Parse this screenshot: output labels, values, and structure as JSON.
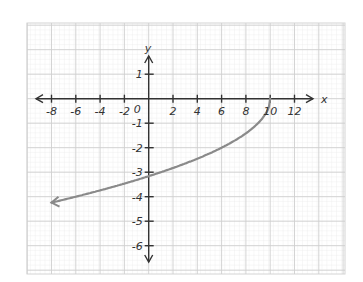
{
  "chart_data": {
    "type": "line",
    "title": "",
    "xlabel": "x",
    "ylabel": "y",
    "origin_label": "0",
    "xlim": [
      -9,
      13
    ],
    "ylim": [
      -7,
      2
    ],
    "x_ticks": [
      -8,
      -6,
      -4,
      -2,
      2,
      4,
      6,
      8,
      10,
      12
    ],
    "x_tick_labels": [
      "-8",
      "-6",
      "-4",
      "-2",
      "2",
      "4",
      "6",
      "8",
      "10",
      "12"
    ],
    "y_ticks": [
      1,
      -1,
      -2,
      -3,
      -4,
      -5,
      -6
    ],
    "y_tick_labels": [
      "1",
      "-1",
      "-2",
      "-3",
      "-4",
      "-5",
      "-6"
    ],
    "grid": true,
    "legend": "none",
    "series": [
      {
        "name": "curve",
        "color": "#8a8a8a",
        "arrow_at_start": true,
        "x": [
          -8,
          -6,
          -4,
          -2,
          0,
          2,
          4,
          6,
          8,
          9,
          9.6,
          10
        ],
        "y": [
          -4.24,
          -4.0,
          -3.74,
          -3.46,
          -3.16,
          -2.83,
          -2.45,
          -2.0,
          -1.41,
          -1.0,
          -0.63,
          0
        ]
      }
    ]
  }
}
